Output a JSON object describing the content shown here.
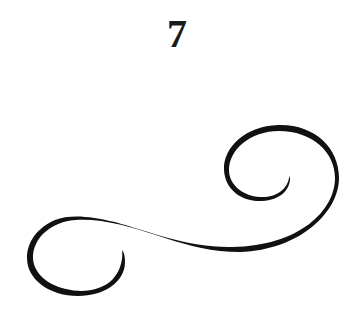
{
  "page": {
    "number": "7"
  },
  "ornament": {
    "name": "calligraphic-flourish",
    "color": "#111111"
  }
}
